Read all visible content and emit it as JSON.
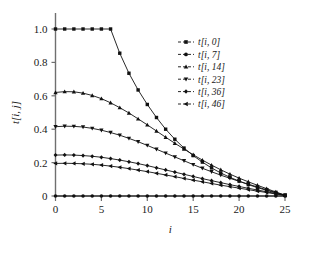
{
  "chart_data": {
    "type": "line",
    "title": "",
    "subtitle": "",
    "xlabel": "i",
    "ylabel": "t[i, j]",
    "xlim": [
      0,
      25
    ],
    "ylim": [
      0,
      1.0
    ],
    "xticks": [
      0,
      5,
      10,
      15,
      20,
      25
    ],
    "xtick_labels": [
      "0",
      "5",
      "10",
      "15",
      "20",
      "25"
    ],
    "yticks": [
      0,
      0.2,
      0.4,
      0.6,
      0.8,
      1.0
    ],
    "ytick_labels": [
      "0",
      "0.2",
      "0.4",
      "0.6",
      "0.8",
      "1.0"
    ],
    "grid": false,
    "frame": "left-bottom",
    "legend_position": "upper-right",
    "legend_border": false,
    "line_color": "#111111",
    "axis_color": "#6f6f6f",
    "background": "#ffffff",
    "x": [
      0,
      1,
      2,
      3,
      4,
      5,
      6,
      7,
      8,
      9,
      10,
      11,
      12,
      13,
      14,
      15,
      16,
      17,
      18,
      19,
      20,
      21,
      22,
      23,
      24,
      25
    ],
    "series": [
      {
        "name": "t[i, 0]",
        "marker": "square",
        "values": [
          1.0,
          1.0,
          1.0,
          1.0,
          1.0,
          1.0,
          1.0,
          0.855,
          0.735,
          0.635,
          0.548,
          0.47,
          0.4,
          0.34,
          0.287,
          0.242,
          0.203,
          0.168,
          0.138,
          0.112,
          0.089,
          0.068,
          0.05,
          0.034,
          0.018,
          0.004
        ]
      },
      {
        "name": "t[i, 7]",
        "marker": "circle",
        "values": [
          0.0,
          0.0,
          0.0,
          0.0,
          0.0,
          0.0,
          0.0,
          0.0,
          0.0,
          0.0,
          0.0,
          0.0,
          0.0,
          0.0,
          0.0,
          0.0,
          0.0,
          0.0,
          0.0,
          0.0,
          0.0,
          0.0,
          0.0,
          0.0,
          0.0,
          0.0
        ]
      },
      {
        "name": "t[i, 14]",
        "marker": "triangle-up",
        "values": [
          0.62,
          0.625,
          0.624,
          0.616,
          0.602,
          0.583,
          0.558,
          0.529,
          0.497,
          0.462,
          0.426,
          0.389,
          0.352,
          0.316,
          0.281,
          0.247,
          0.215,
          0.185,
          0.157,
          0.131,
          0.107,
          0.085,
          0.064,
          0.044,
          0.024,
          0.005
        ]
      },
      {
        "name": "t[i, 23]",
        "marker": "triangle-down",
        "values": [
          0.415,
          0.418,
          0.417,
          0.413,
          0.405,
          0.394,
          0.38,
          0.364,
          0.345,
          0.325,
          0.303,
          0.28,
          0.257,
          0.234,
          0.211,
          0.188,
          0.166,
          0.145,
          0.125,
          0.106,
          0.088,
          0.071,
          0.054,
          0.037,
          0.021,
          0.005
        ]
      },
      {
        "name": "t[i, 36]",
        "marker": "diamond",
        "values": [
          0.245,
          0.246,
          0.245,
          0.242,
          0.238,
          0.232,
          0.224,
          0.215,
          0.205,
          0.194,
          0.182,
          0.169,
          0.156,
          0.143,
          0.13,
          0.117,
          0.104,
          0.092,
          0.08,
          0.068,
          0.057,
          0.046,
          0.036,
          0.025,
          0.015,
          0.004
        ]
      },
      {
        "name": "t[i, 46]",
        "marker": "triangle-left",
        "values": [
          0.195,
          0.196,
          0.195,
          0.193,
          0.19,
          0.185,
          0.179,
          0.172,
          0.164,
          0.155,
          0.146,
          0.136,
          0.126,
          0.116,
          0.105,
          0.095,
          0.085,
          0.075,
          0.065,
          0.056,
          0.047,
          0.038,
          0.029,
          0.021,
          0.012,
          0.003
        ]
      }
    ]
  }
}
